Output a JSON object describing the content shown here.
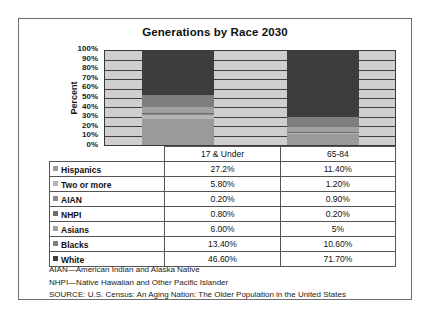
{
  "chart_data": {
    "type": "bar",
    "title": "Generations by Race 2030",
    "xlabel": "",
    "ylabel": "Percent",
    "ylim": [
      0,
      100
    ],
    "grid": true,
    "stacked": true,
    "legend_position": "table-row-headers",
    "categories": [
      "17 & Under",
      "65-84"
    ],
    "y_ticks": [
      "100%",
      "90%",
      "80%",
      "70%",
      "60%",
      "50%",
      "40%",
      "30%",
      "20%",
      "10%",
      "0%"
    ],
    "series": [
      {
        "name": "Hispanics",
        "values": [
          27.2,
          11.4
        ],
        "labels": [
          "27.2%",
          "11.40%"
        ],
        "color": "#9a9a9a"
      },
      {
        "name": "Two or more",
        "values": [
          5.8,
          1.2
        ],
        "labels": [
          "5.80%",
          "1.20%"
        ],
        "color": "#b4b4b4"
      },
      {
        "name": "AIAN",
        "values": [
          0.2,
          0.9
        ],
        "labels": [
          "0.20%",
          "0.90%"
        ],
        "color": "#8a8a8a"
      },
      {
        "name": "NHPI",
        "values": [
          0.8,
          0.2
        ],
        "labels": [
          "0.80%",
          "0.20%"
        ],
        "color": "#6d6d6d"
      },
      {
        "name": "Asians",
        "values": [
          6.0,
          5.0
        ],
        "labels": [
          "6.00%",
          "5%"
        ],
        "color": "#a0a0a0"
      },
      {
        "name": "Blacks",
        "values": [
          13.4,
          10.6
        ],
        "labels": [
          "13.40%",
          "10.60%"
        ],
        "color": "#7e7e7e"
      },
      {
        "name": "White",
        "values": [
          46.6,
          71.7
        ],
        "labels": [
          "46.60%",
          "71.70%"
        ],
        "color": "#3d3d3d"
      }
    ],
    "plot_background": "#cfcfcf"
  },
  "table": {
    "corner": "",
    "column_headers": [
      "17 & Under",
      "65-84"
    ],
    "rows": [
      {
        "label": "Hispanics",
        "values": [
          "27.2%",
          "11.40%"
        ]
      },
      {
        "label": "Two or more",
        "values": [
          "5.80%",
          "1.20%"
        ]
      },
      {
        "label": "AIAN",
        "values": [
          "0.20%",
          "0.90%"
        ]
      },
      {
        "label": "NHPI",
        "values": [
          "0.80%",
          "0.20%"
        ]
      },
      {
        "label": "Asians",
        "values": [
          "6.00%",
          "5%"
        ]
      },
      {
        "label": "Blacks",
        "values": [
          "13.40%",
          "10.60%"
        ]
      },
      {
        "label": "White",
        "values": [
          "46.60%",
          "71.70%"
        ]
      }
    ]
  },
  "footnotes": [
    "AIAN—American Indian and Alaska Native",
    "NHPI—Native Hawaiian and Other Pacific Islander",
    "SOURCE: U.S. Census: An Aging Nation: The Older Population in the United States"
  ]
}
